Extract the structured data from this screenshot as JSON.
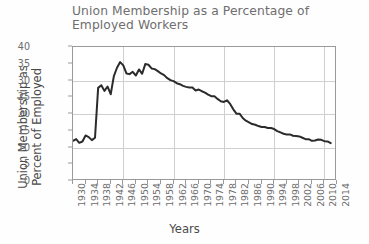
{
  "chart_data": {
    "type": "line",
    "title": "Union Membership as a Percentage of\nEmployed Workers",
    "xlabel": "Years",
    "ylabel": "Union Membership as\nPercent of Employed",
    "xlim": [
      1930,
      2014
    ],
    "ylim": [
      0,
      40
    ],
    "ytick_step": 5,
    "xtick_step": 4,
    "grid": {
      "horizontal_step": 10,
      "vertical_step": 16,
      "visible": true
    },
    "legend": null,
    "line_color": "#2b2b2b",
    "line_width": 2,
    "yticks": [
      0,
      5,
      10,
      15,
      20,
      25,
      30,
      35,
      40
    ],
    "xticks": [
      1930,
      1934,
      1938,
      1942,
      1946,
      1950,
      1954,
      1958,
      1962,
      1966,
      1970,
      1974,
      1978,
      1982,
      1986,
      1990,
      1994,
      1998,
      2002,
      2006,
      2010,
      2014
    ],
    "series": [
      {
        "name": "Union membership percent of employed",
        "x": [
          1930,
          1931,
          1932,
          1933,
          1934,
          1935,
          1936,
          1937,
          1938,
          1939,
          1940,
          1941,
          1942,
          1943,
          1944,
          1945,
          1946,
          1947,
          1948,
          1949,
          1950,
          1951,
          1952,
          1953,
          1954,
          1955,
          1956,
          1957,
          1958,
          1959,
          1960,
          1961,
          1962,
          1963,
          1964,
          1965,
          1966,
          1967,
          1968,
          1969,
          1970,
          1971,
          1972,
          1973,
          1974,
          1975,
          1976,
          1977,
          1978,
          1979,
          1980,
          1981,
          1982,
          1983,
          1984,
          1985,
          1986,
          1987,
          1988,
          1989,
          1990,
          1991,
          1992,
          1993,
          1994,
          1995,
          1996,
          1997,
          1998,
          1999,
          2000,
          2001,
          2002,
          2003,
          2004,
          2005,
          2006,
          2007,
          2008,
          2009,
          2010,
          2011,
          2012
        ],
        "values": [
          12.0,
          12.5,
          11.4,
          11.8,
          13.6,
          13.1,
          12.2,
          12.9,
          27.8,
          28.6,
          26.9,
          28.2,
          25.9,
          31.3,
          33.8,
          35.5,
          34.5,
          32.1,
          31.9,
          32.6,
          31.5,
          33.3,
          32.0,
          34.9,
          34.7,
          33.6,
          33.4,
          32.8,
          32.1,
          31.6,
          30.7,
          30.1,
          29.8,
          29.2,
          28.9,
          28.4,
          28.1,
          27.9,
          27.9,
          27.0,
          27.3,
          26.8,
          26.4,
          25.8,
          25.3,
          25.3,
          24.5,
          23.8,
          23.6,
          24.1,
          23.0,
          21.4,
          20.1,
          20.1,
          18.8,
          18.0,
          17.5,
          17.0,
          16.8,
          16.4,
          16.1,
          16.1,
          15.8,
          15.8,
          15.5,
          14.9,
          14.5,
          14.1,
          13.9,
          13.9,
          13.5,
          13.4,
          13.3,
          12.9,
          12.5,
          12.5,
          12.0,
          12.1,
          12.4,
          12.3,
          11.9,
          11.8,
          11.3
        ]
      }
    ]
  }
}
